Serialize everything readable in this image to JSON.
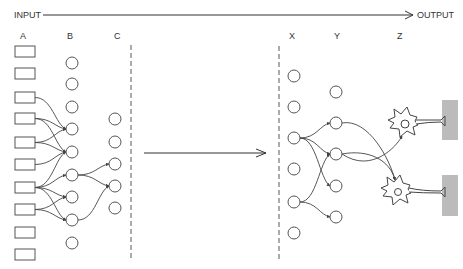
{
  "labels": {
    "input": "INPUT",
    "output": "OUTPUT",
    "columns": {
      "A": "A",
      "B": "B",
      "C": "C",
      "X": "X",
      "Y": "Y",
      "Z": "Z"
    }
  },
  "colors": {
    "stroke": "#444444",
    "text": "#333333",
    "background": "#ffffff"
  },
  "layout": {
    "top_arrow": {
      "x1": 43,
      "x2": 413,
      "y": 15
    },
    "middle_arrow": {
      "x1": 144,
      "x2": 266,
      "y": 153
    },
    "dashed_lines": [
      {
        "x": 131,
        "y1": 45,
        "y2": 260
      },
      {
        "x": 279,
        "y1": 46,
        "y2": 259
      }
    ]
  },
  "columns": {
    "A": {
      "shape": "box",
      "x": 15,
      "w": 20,
      "h": 11,
      "label_pos": [
        23,
        39
      ],
      "nodes_y": [
        46,
        68,
        92,
        113,
        137,
        159,
        182,
        204,
        227,
        249
      ]
    },
    "B": {
      "shape": "circle",
      "cx": 72,
      "r": 6,
      "label_pos": [
        70,
        39
      ],
      "nodes_y": [
        63,
        84,
        107,
        129,
        152,
        175,
        197,
        220,
        243
      ]
    },
    "C": {
      "shape": "circle",
      "cx": 115,
      "r": 6,
      "label_pos": [
        117,
        39
      ],
      "nodes_y": [
        119,
        142,
        164,
        186,
        208
      ]
    },
    "X": {
      "shape": "circle",
      "cx": 294,
      "r": 6,
      "label_pos": [
        292,
        39
      ],
      "nodes_y": [
        76,
        107,
        138,
        169,
        202,
        233
      ]
    },
    "Y": {
      "shape": "circle",
      "cx": 336,
      "r": 6,
      "label_pos": [
        337,
        39
      ],
      "nodes_y": [
        92,
        123,
        154,
        186,
        217
      ]
    },
    "Z": {
      "shape": "neuron",
      "label_pos": [
        400,
        39
      ],
      "neurons": [
        {
          "cx": 404,
          "cy": 122,
          "nucleus_r": 4,
          "axon_end_x": 445,
          "axon_y": 121,
          "muscle": {
            "x": 443,
            "y1": 100,
            "y2": 140
          }
        },
        {
          "cx": 397,
          "cy": 190,
          "nucleus_r": 3.5,
          "axon_end_x": 445,
          "axon_y": 192,
          "muscle": {
            "x": 443,
            "y1": 175,
            "y2": 216
          }
        }
      ]
    }
  },
  "connections": [
    {
      "from": [
        "A",
        2
      ],
      "to": [
        "B",
        3
      ]
    },
    {
      "from": [
        "A",
        3
      ],
      "to": [
        "B",
        3
      ]
    },
    {
      "from": [
        "A",
        3
      ],
      "to": [
        "B",
        4
      ]
    },
    {
      "from": [
        "A",
        4
      ],
      "to": [
        "B",
        3
      ]
    },
    {
      "from": [
        "A",
        4
      ],
      "to": [
        "B",
        4
      ]
    },
    {
      "from": [
        "A",
        5
      ],
      "to": [
        "B",
        4
      ]
    },
    {
      "from": [
        "A",
        6
      ],
      "to": [
        "B",
        4
      ]
    },
    {
      "from": [
        "A",
        6
      ],
      "to": [
        "B",
        5
      ]
    },
    {
      "from": [
        "A",
        6
      ],
      "to": [
        "B",
        6
      ]
    },
    {
      "from": [
        "A",
        6
      ],
      "to": [
        "B",
        7
      ]
    },
    {
      "from": [
        "A",
        7
      ],
      "to": [
        "B",
        6
      ]
    },
    {
      "from": [
        "A",
        7
      ],
      "to": [
        "B",
        7
      ]
    },
    {
      "from": [
        "B",
        5
      ],
      "to": [
        "C",
        2
      ]
    },
    {
      "from": [
        "B",
        5
      ],
      "to": [
        "C",
        3
      ]
    },
    {
      "from": [
        "B",
        7
      ],
      "to": [
        "C",
        3
      ]
    },
    {
      "from": [
        "X",
        2
      ],
      "to": [
        "Y",
        1
      ]
    },
    {
      "from": [
        "X",
        2
      ],
      "to": [
        "Y",
        2
      ]
    },
    {
      "from": [
        "X",
        2
      ],
      "to": [
        "Y",
        3
      ]
    },
    {
      "from": [
        "X",
        4
      ],
      "to": [
        "Y",
        2
      ]
    },
    {
      "from": [
        "X",
        4
      ],
      "to": [
        "Y",
        4
      ]
    },
    {
      "from": [
        "Y",
        1
      ],
      "to": [
        "Z",
        1
      ]
    },
    {
      "from": [
        "Y",
        2
      ],
      "to": [
        "Z",
        0
      ]
    },
    {
      "from": [
        "Y",
        2
      ],
      "to": [
        "Z",
        1
      ]
    }
  ]
}
